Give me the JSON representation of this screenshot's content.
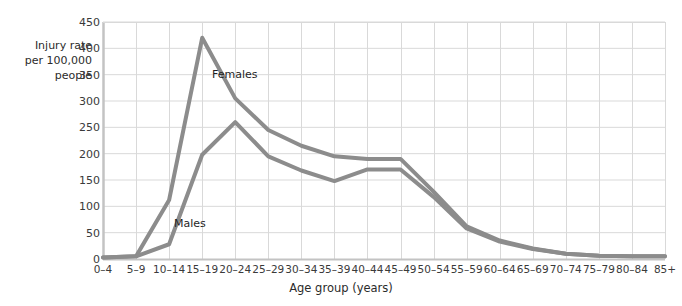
{
  "chart_data": {
    "type": "line",
    "title": "",
    "xlabel": "Age group (years)",
    "ylabel": "Injury rate\nper 100,000\npeople",
    "categories": [
      "0–4",
      "5–9",
      "10–14",
      "15–19",
      "20–24",
      "25–29",
      "30–34",
      "35–39",
      "40–44",
      "45–49",
      "50–54",
      "55–59",
      "60–64",
      "65–69",
      "70–74",
      "75–79",
      "80–84",
      "85+"
    ],
    "series": [
      {
        "name": "Females",
        "color": "#8c8c8c",
        "values": [
          3,
          5,
          112,
          420,
          305,
          245,
          215,
          195,
          190,
          190,
          128,
          62,
          35,
          20,
          10,
          6,
          5,
          5
        ]
      },
      {
        "name": "Males",
        "color": "#8c8c8c",
        "values": [
          3,
          5,
          28,
          198,
          260,
          195,
          168,
          148,
          170,
          170,
          118,
          58,
          33,
          19,
          10,
          6,
          5,
          5
        ]
      }
    ],
    "ylim": [
      0,
      450
    ],
    "ytick_values": [
      0,
      50,
      100,
      150,
      200,
      250,
      300,
      350,
      400,
      450
    ],
    "ytick_labels": [
      "0",
      "50",
      "100",
      "150",
      "200",
      "250",
      "300",
      "350",
      "400",
      "450"
    ],
    "grid": true,
    "grid_color": "#d9d9d9",
    "legend": "inline-annotations",
    "annotations": [
      {
        "text": "Females",
        "series": "Females",
        "x_px": 212,
        "y_px": 68
      },
      {
        "text": "Males",
        "series": "Males",
        "x_px": 174,
        "y_px": 217
      }
    ],
    "axis_color": "#c3c3c3",
    "background": "#ffffff"
  }
}
